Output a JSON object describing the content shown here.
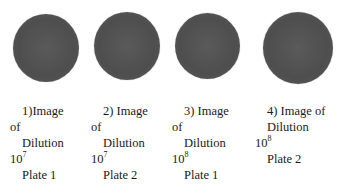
{
  "figure": {
    "panels": [
      {
        "id": 1,
        "caption_lines": [
          "1)Image",
          "of",
          "Dilution",
          "10",
          "Plate 1"
        ],
        "dilution_base": "10",
        "dilution_exp": "7",
        "plate": "Plate 1",
        "plate_color": "#555555"
      },
      {
        "id": 2,
        "caption_lines": [
          "2)  Image",
          "of",
          "Dilution",
          "10",
          "Plate 2"
        ],
        "dilution_base": "10",
        "dilution_exp": "7",
        "plate": "Plate 2",
        "plate_color": "#555555"
      },
      {
        "id": 3,
        "caption_lines": [
          "3)   Image",
          "of",
          "Dilution",
          "10",
          "Plate 1"
        ],
        "dilution_base": "10",
        "dilution_exp": "8",
        "plate": "Plate 1",
        "plate_color": "#555555"
      },
      {
        "id": 4,
        "caption_lines": [
          "4) Image of",
          "Dilution",
          "10",
          "Plate 2"
        ],
        "dilution_base": "10",
        "dilution_exp": "8",
        "plate": "Plate 2",
        "plate_color": "#555555"
      }
    ]
  }
}
